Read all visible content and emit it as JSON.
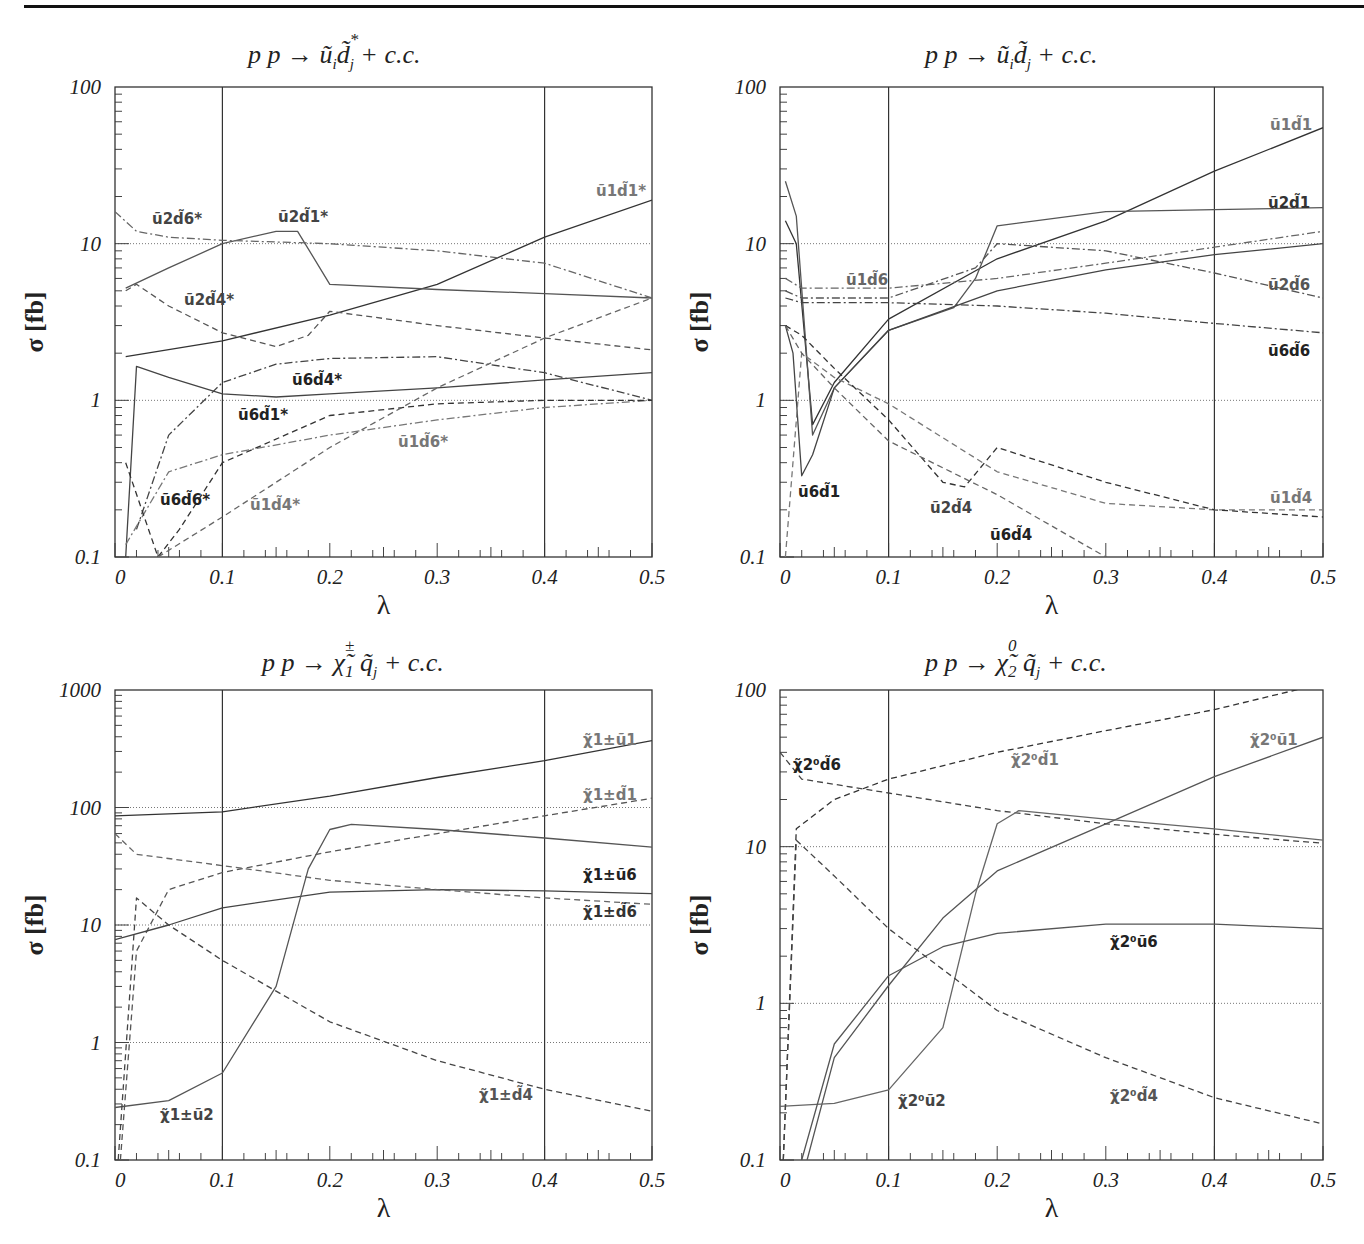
{
  "chart_data": [
    {
      "type": "line",
      "id": "tl",
      "title": "p p → ũ_i d̃_j^* + c.c.",
      "title_parts": {
        "lead": "p p  →",
        "main": "ũ",
        "sub1": "i",
        "main2": "d̃",
        "sup2": "*",
        "sub2": "j",
        "tail": "+ c.c."
      },
      "xlabel": "λ",
      "ylabel": "σ [fb]",
      "yscale": "log",
      "ylim": [
        0.1,
        100
      ],
      "xlim": [
        0,
        0.5
      ],
      "xticks": [
        "0",
        "0.1",
        "0.2",
        "0.3",
        "0.4",
        "0.5"
      ],
      "yticks": [
        "0.1",
        "1",
        "10",
        "100"
      ],
      "vlines": [
        0.1,
        0.4
      ],
      "series": [
        {
          "name": "ũ1d̃1*",
          "style": "solid",
          "x": [
            0.01,
            0.1,
            0.2,
            0.3,
            0.4,
            0.5
          ],
          "values": [
            1.9,
            2.4,
            3.5,
            5.5,
            11,
            19
          ]
        },
        {
          "name": "ũ2d̃1*",
          "style": "solid",
          "x": [
            0.01,
            0.05,
            0.1,
            0.15,
            0.17,
            0.2,
            0.3,
            0.4,
            0.5
          ],
          "values": [
            5.2,
            7,
            10,
            12,
            12,
            5.5,
            5.1,
            4.8,
            4.5
          ]
        },
        {
          "name": "ũ6d̃1*",
          "style": "solid",
          "x": [
            0.01,
            0.02,
            0.05,
            0.1,
            0.15,
            0.2,
            0.3,
            0.4,
            0.5
          ],
          "values": [
            0.1,
            1.65,
            1.4,
            1.1,
            1.05,
            1.1,
            1.2,
            1.35,
            1.5
          ]
        },
        {
          "name": "ũ2d̃6*",
          "style": "dashdot",
          "x": [
            0,
            0.02,
            0.05,
            0.1,
            0.2,
            0.3,
            0.4,
            0.5
          ],
          "values": [
            16,
            12,
            11,
            10.5,
            10,
            9,
            7.5,
            4.5
          ]
        },
        {
          "name": "ũ2d̃4*",
          "style": "dashed",
          "x": [
            0.01,
            0.02,
            0.05,
            0.1,
            0.15,
            0.18,
            0.2,
            0.3,
            0.4,
            0.5
          ],
          "values": [
            5,
            5.5,
            4,
            2.7,
            2.2,
            2.6,
            3.7,
            3,
            2.5,
            2.1
          ]
        },
        {
          "name": "ũ6d̃4*",
          "style": "dashdot",
          "x": [
            0.02,
            0.05,
            0.1,
            0.15,
            0.2,
            0.3,
            0.4,
            0.5
          ],
          "values": [
            0.15,
            0.6,
            1.3,
            1.7,
            1.85,
            1.9,
            1.5,
            1.0
          ]
        },
        {
          "name": "ũ1d̃6*",
          "style": "dashdot",
          "x": [
            0.01,
            0.05,
            0.1,
            0.2,
            0.3,
            0.4,
            0.5
          ],
          "values": [
            0.12,
            0.35,
            0.45,
            0.6,
            0.75,
            0.9,
            1.0
          ]
        },
        {
          "name": "ũ6d̃6*",
          "style": "dashed",
          "x": [
            0.01,
            0.04,
            0.06,
            0.1,
            0.2,
            0.3,
            0.4,
            0.5
          ],
          "values": [
            0.4,
            0.1,
            0.15,
            0.4,
            0.8,
            0.95,
            1.0,
            1.0
          ]
        },
        {
          "name": "ũ1d̃4*",
          "style": "dashed",
          "x": [
            0.04,
            0.1,
            0.15,
            0.2,
            0.3,
            0.4,
            0.5
          ],
          "values": [
            0.1,
            0.18,
            0.3,
            0.5,
            1.2,
            2.5,
            4.5
          ]
        }
      ]
    },
    {
      "type": "line",
      "id": "tr",
      "title": "p p → ũ_i d̃_j + c.c.",
      "title_parts": {
        "lead": "p p  →",
        "main": "ũ",
        "sub1": "i",
        "main2": "d̃",
        "sup2": "",
        "sub2": "j",
        "tail": "+ c.c."
      },
      "xlabel": "λ",
      "ylabel": "σ [fb]",
      "yscale": "log",
      "ylim": [
        0.1,
        100
      ],
      "xlim": [
        0,
        0.5
      ],
      "xticks": [
        "0",
        "0.1",
        "0.2",
        "0.3",
        "0.4",
        "0.5"
      ],
      "yticks": [
        "0.1",
        "1",
        "10",
        "100"
      ],
      "vlines": [
        0.1,
        0.4
      ],
      "series": [
        {
          "name": "ũ1d̃1",
          "style": "solid",
          "x": [
            0.005,
            0.015,
            0.03,
            0.05,
            0.1,
            0.2,
            0.3,
            0.4,
            0.5
          ],
          "values": [
            14,
            10,
            0.7,
            1.3,
            3.3,
            8,
            14,
            29,
            55
          ]
        },
        {
          "name": "ũ2d̃1",
          "style": "solid",
          "x": [
            0.005,
            0.015,
            0.03,
            0.05,
            0.1,
            0.16,
            0.18,
            0.2,
            0.3,
            0.4,
            0.5
          ],
          "values": [
            25,
            15,
            0.6,
            1.2,
            2.8,
            3.9,
            6,
            13,
            16,
            16.5,
            17
          ]
        },
        {
          "name": "ũ6d̃1",
          "style": "solid",
          "x": [
            0.005,
            0.012,
            0.02,
            0.03,
            0.05,
            0.1,
            0.2,
            0.3,
            0.4,
            0.5
          ],
          "values": [
            3,
            2,
            0.33,
            0.45,
            1.2,
            2.8,
            5,
            6.8,
            8.5,
            10
          ]
        },
        {
          "name": "ũ1d̃6",
          "style": "dashdot",
          "x": [
            0.005,
            0.02,
            0.1,
            0.2,
            0.3,
            0.4,
            0.5
          ],
          "values": [
            6,
            5.2,
            5.2,
            6,
            7.5,
            9.5,
            12
          ]
        },
        {
          "name": "ũ2d̃6",
          "style": "dashdot",
          "x": [
            0.005,
            0.02,
            0.1,
            0.18,
            0.2,
            0.3,
            0.4,
            0.5
          ],
          "values": [
            5,
            4.5,
            4.5,
            7,
            10,
            9,
            6.5,
            4.5
          ]
        },
        {
          "name": "ũ6d̃6",
          "style": "dashdot",
          "x": [
            0.005,
            0.02,
            0.1,
            0.2,
            0.3,
            0.4,
            0.5
          ],
          "values": [
            4.5,
            4.2,
            4.2,
            4,
            3.6,
            3.1,
            2.7
          ]
        },
        {
          "name": "ũ1d̃4",
          "style": "dashed",
          "x": [
            0.005,
            0.02,
            0.05,
            0.1,
            0.2,
            0.3,
            0.4,
            0.5
          ],
          "values": [
            0.1,
            2,
            1.4,
            0.95,
            0.35,
            0.22,
            0.2,
            0.2
          ]
        },
        {
          "name": "ũ2d̃4",
          "style": "dashed",
          "x": [
            0.005,
            0.02,
            0.05,
            0.1,
            0.15,
            0.17,
            0.2,
            0.3,
            0.4,
            0.5
          ],
          "values": [
            3,
            2.6,
            1.6,
            0.75,
            0.3,
            0.28,
            0.5,
            0.3,
            0.2,
            0.18
          ]
        },
        {
          "name": "ũ6d̃4",
          "style": "dashed",
          "x": [
            0.005,
            0.02,
            0.05,
            0.1,
            0.2,
            0.3,
            0.4,
            0.5
          ],
          "values": [
            3,
            2,
            1.2,
            0.55,
            0.25,
            0.1,
            0.06,
            0.04
          ]
        }
      ]
    },
    {
      "type": "line",
      "id": "bl",
      "title": "p p → χ̃1± q̃_j + c.c.",
      "title_parts": {
        "lead": "p p  →",
        "main": "χ̃",
        "sup1": "±",
        "sub1": "1",
        "main2": "q̃",
        "sup2": "",
        "sub2": "j",
        "tail": "+ c.c."
      },
      "xlabel": "λ",
      "ylabel": "σ [fb]",
      "yscale": "log",
      "ylim": [
        0.1,
        1000
      ],
      "xlim": [
        0,
        0.5
      ],
      "xticks": [
        "0",
        "0.1",
        "0.2",
        "0.3",
        "0.4",
        "0.5"
      ],
      "yticks": [
        "0.1",
        "1",
        "10",
        "100",
        "1000"
      ],
      "vlines": [
        0.1,
        0.4
      ],
      "series": [
        {
          "name": "χ̃1±ũ1",
          "style": "solid",
          "x": [
            0,
            0.1,
            0.2,
            0.3,
            0.4,
            0.5
          ],
          "values": [
            85,
            92,
            125,
            180,
            250,
            370
          ]
        },
        {
          "name": "χ̃1±d̃1",
          "style": "dashed",
          "x": [
            0.005,
            0.02,
            0.05,
            0.1,
            0.2,
            0.3,
            0.4,
            0.5
          ],
          "values": [
            0.1,
            6,
            20,
            28,
            42,
            60,
            85,
            120
          ]
        },
        {
          "name": "χ̃1±ũ6",
          "style": "solid",
          "x": [
            0,
            0.05,
            0.1,
            0.2,
            0.3,
            0.4,
            0.5
          ],
          "values": [
            7.5,
            10,
            14,
            19,
            20,
            19.5,
            18.5
          ]
        },
        {
          "name": "χ̃1±d̃6",
          "style": "dashed",
          "x": [
            0,
            0.02,
            0.1,
            0.2,
            0.3,
            0.4,
            0.5
          ],
          "values": [
            60,
            40,
            32,
            24,
            20,
            17,
            15
          ]
        },
        {
          "name": "χ̃1±ũ2",
          "style": "solid",
          "x": [
            0,
            0.05,
            0.1,
            0.15,
            0.18,
            0.2,
            0.22,
            0.3,
            0.4,
            0.5
          ],
          "values": [
            0.28,
            0.32,
            0.55,
            3,
            30,
            65,
            72,
            65,
            55,
            46
          ]
        },
        {
          "name": "χ̃1±d̃4",
          "style": "dashed",
          "x": [
            0.003,
            0.02,
            0.05,
            0.1,
            0.2,
            0.3,
            0.4,
            0.5
          ],
          "values": [
            0.1,
            17,
            10,
            5,
            1.5,
            0.7,
            0.4,
            0.26
          ]
        }
      ]
    },
    {
      "type": "line",
      "id": "br",
      "title": "p p → χ̃2⁰ q̃_j + c.c.",
      "title_parts": {
        "lead": "p p  →",
        "main": "χ̃",
        "sup1": "0",
        "sub1": "2",
        "main2": "q̃",
        "sup2": "",
        "sub2": "j",
        "tail": "+ c.c."
      },
      "xlabel": "λ",
      "ylabel": "σ [fb]",
      "yscale": "log",
      "ylim": [
        0.1,
        100
      ],
      "xlim": [
        0,
        0.5
      ],
      "xticks": [
        "0",
        "0.1",
        "0.2",
        "0.3",
        "0.4",
        "0.5"
      ],
      "yticks": [
        "0.1",
        "1",
        "10",
        "100"
      ],
      "vlines": [
        0.1,
        0.4
      ],
      "series": [
        {
          "name": "χ̃2⁰d̃1",
          "style": "dashed",
          "x": [
            0.003,
            0.015,
            0.05,
            0.1,
            0.2,
            0.3,
            0.4,
            0.5
          ],
          "values": [
            0.1,
            13,
            20,
            27,
            40,
            55,
            75,
            110
          ]
        },
        {
          "name": "χ̃2⁰ũ1",
          "style": "solid",
          "x": [
            0.025,
            0.05,
            0.1,
            0.15,
            0.2,
            0.3,
            0.4,
            0.5
          ],
          "values": [
            0.1,
            0.45,
            1.3,
            3.5,
            7,
            14,
            28,
            50
          ]
        },
        {
          "name": "χ̃2⁰d̃6",
          "style": "dashed",
          "x": [
            0,
            0.02,
            0.1,
            0.2,
            0.3,
            0.4,
            0.5
          ],
          "values": [
            40,
            27,
            22,
            17,
            14,
            12,
            10.5
          ]
        },
        {
          "name": "χ̃2⁰ũ2",
          "style": "solid",
          "x": [
            0,
            0.05,
            0.1,
            0.15,
            0.18,
            0.2,
            0.22,
            0.3,
            0.4,
            0.5
          ],
          "values": [
            0.22,
            0.23,
            0.28,
            0.7,
            5,
            14,
            17,
            15,
            13,
            11
          ]
        },
        {
          "name": "χ̃2⁰ũ6",
          "style": "solid",
          "x": [
            0.02,
            0.05,
            0.1,
            0.15,
            0.2,
            0.3,
            0.4,
            0.5
          ],
          "values": [
            0.1,
            0.55,
            1.5,
            2.3,
            2.8,
            3.2,
            3.2,
            3.0
          ]
        },
        {
          "name": "χ̃2⁰d̃4",
          "style": "dashed",
          "x": [
            0.003,
            0.015,
            0.05,
            0.1,
            0.2,
            0.3,
            0.4,
            0.5
          ],
          "values": [
            0.1,
            11,
            6.5,
            3,
            0.9,
            0.45,
            0.25,
            0.17
          ]
        }
      ]
    }
  ],
  "labels": {
    "tl": [
      {
        "text": "ũ2d̃6*",
        "x": 152,
        "y": 224,
        "color": "#444"
      },
      {
        "text": "ũ2d̃1*",
        "x": 278,
        "y": 222,
        "color": "#444"
      },
      {
        "text": "ũ1d̃1*",
        "x": 596,
        "y": 196,
        "color": "#777"
      },
      {
        "text": "ũ2d̃4*",
        "x": 184,
        "y": 305,
        "color": "#444"
      },
      {
        "text": "ũ6d̃4*",
        "x": 292,
        "y": 385,
        "color": "#222"
      },
      {
        "text": "ũ6d̃1*",
        "x": 238,
        "y": 420,
        "color": "#222"
      },
      {
        "text": "ũ1d̃6*",
        "x": 398,
        "y": 447,
        "color": "#777"
      },
      {
        "text": "ũ6d̃6*",
        "x": 160,
        "y": 505,
        "color": "#222"
      },
      {
        "text": "ũ1d̃4*",
        "x": 250,
        "y": 510,
        "color": "#777"
      }
    ],
    "tr": [
      {
        "text": "ũ1d̃1",
        "x": 1270,
        "y": 130,
        "color": "#777"
      },
      {
        "text": "ũ2d̃1",
        "x": 1268,
        "y": 208,
        "color": "#333"
      },
      {
        "text": "ũ1d̃6",
        "x": 846,
        "y": 285,
        "color": "#666"
      },
      {
        "text": "ũ2d̃6",
        "x": 1268,
        "y": 290,
        "color": "#555"
      },
      {
        "text": "ũ6d̃6",
        "x": 1268,
        "y": 356,
        "color": "#222"
      },
      {
        "text": "ũ6d̃1",
        "x": 798,
        "y": 497,
        "color": "#222"
      },
      {
        "text": "ũ2d̃4",
        "x": 930,
        "y": 513,
        "color": "#444"
      },
      {
        "text": "ũ1d̃4",
        "x": 1270,
        "y": 503,
        "color": "#777"
      },
      {
        "text": "ũ6d̃4",
        "x": 990,
        "y": 540,
        "color": "#222"
      }
    ],
    "bl": [
      {
        "text": "χ̃1±ũ1",
        "x": 583,
        "y": 745,
        "color": "#777"
      },
      {
        "text": "χ̃1±d̃1",
        "x": 583,
        "y": 800,
        "color": "#777"
      },
      {
        "text": "χ̃1±ũ6",
        "x": 583,
        "y": 880,
        "color": "#222"
      },
      {
        "text": "χ̃1±d̃6",
        "x": 583,
        "y": 917,
        "color": "#333"
      },
      {
        "text": "χ̃1±ũ2",
        "x": 160,
        "y": 1120,
        "color": "#444"
      },
      {
        "text": "χ̃1±d̃4",
        "x": 479,
        "y": 1100,
        "color": "#555"
      }
    ],
    "br": [
      {
        "text": "χ̃2⁰d̃1",
        "x": 1011,
        "y": 765,
        "color": "#777"
      },
      {
        "text": "χ̃2⁰ũ1",
        "x": 1250,
        "y": 745,
        "color": "#777"
      },
      {
        "text": "χ̃2⁰d̃6",
        "x": 793,
        "y": 770,
        "color": "#222"
      },
      {
        "text": "χ̃2⁰ũ6",
        "x": 1110,
        "y": 947,
        "color": "#222"
      },
      {
        "text": "χ̃2⁰ũ2",
        "x": 898,
        "y": 1106,
        "color": "#444"
      },
      {
        "text": "χ̃2⁰d̃4",
        "x": 1110,
        "y": 1101,
        "color": "#555"
      }
    ]
  },
  "colors": {
    "axis": "#333333",
    "grid": "#777777",
    "ink": "#222222"
  }
}
